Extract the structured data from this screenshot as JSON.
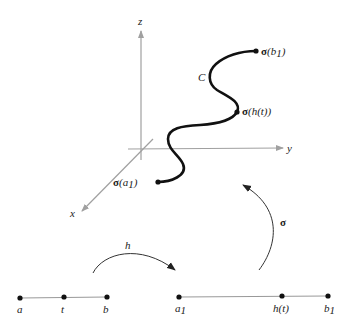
{
  "figure": {
    "colors": {
      "axis": "#a0a0a0",
      "curve": "#111111",
      "segment": "#999999",
      "point": "#111111",
      "arrow": "#333333"
    },
    "axes": {
      "x_label": "x",
      "y_label": "y",
      "z_label": "z"
    },
    "curve": {
      "label": "C",
      "start_label_sigma": "σ",
      "start_label_arg": "(a",
      "start_label_sub": "1",
      "start_label_close": ")",
      "mid_label_sigma": "σ",
      "mid_label_arg": "(h(t))",
      "end_label_sigma": "σ",
      "end_label_arg": "(b",
      "end_label_sub": "1",
      "end_label_close": ")"
    },
    "domain_segment": {
      "points": [
        {
          "label": "a",
          "x": 20
        },
        {
          "label": "t",
          "x": 64
        },
        {
          "label": "b",
          "x": 107
        }
      ]
    },
    "range_segment": {
      "points": [
        {
          "label": "a",
          "sub": "1",
          "x": 179
        },
        {
          "label": "h(t)",
          "x": 282
        },
        {
          "label": "b",
          "sub": "1",
          "x": 328
        }
      ]
    },
    "maps": {
      "h_label": "h",
      "sigma_label": "σ"
    }
  }
}
